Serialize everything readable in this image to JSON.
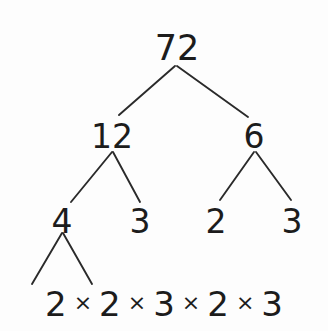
{
  "diagram": {
    "type": "factor-tree",
    "background_color": "#fdfdfd",
    "text_color": "#1c1c1c",
    "line_color": "#2a2a2a",
    "nodes": {
      "root": {
        "label": "72",
        "x": 177,
        "y": 31
      },
      "level1": [
        {
          "label": "12",
          "x": 112,
          "y": 120
        },
        {
          "label": "6",
          "x": 254,
          "y": 120
        }
      ],
      "level2": [
        {
          "label": "4",
          "x": 62,
          "y": 205
        },
        {
          "label": "3",
          "x": 140,
          "y": 205
        },
        {
          "label": "2",
          "x": 216,
          "y": 205
        },
        {
          "label": "3",
          "x": 292,
          "y": 205
        }
      ]
    },
    "edges": [
      {
        "from": "72",
        "to": "12",
        "x1": 175,
        "y1": 66,
        "x2": 119,
        "y2": 115
      },
      {
        "from": "72",
        "to": "6",
        "x1": 177,
        "y1": 66,
        "x2": 248,
        "y2": 117
      },
      {
        "from": "12",
        "to": "4",
        "x1": 112,
        "y1": 152,
        "x2": 71,
        "y2": 202
      },
      {
        "from": "12",
        "to": "3",
        "x1": 113,
        "y1": 152,
        "x2": 140,
        "y2": 202
      },
      {
        "from": "6",
        "to": "2",
        "x1": 254,
        "y1": 152,
        "x2": 220,
        "y2": 200
      },
      {
        "from": "6",
        "to": "3",
        "x1": 256,
        "y1": 152,
        "x2": 291,
        "y2": 200
      },
      {
        "from": "4",
        "to": "2a",
        "x1": 62,
        "y1": 233,
        "x2": 32,
        "y2": 284
      },
      {
        "from": "4",
        "to": "2b",
        "x1": 63,
        "y1": 233,
        "x2": 92,
        "y2": 284
      }
    ],
    "product": {
      "expression": "2 × 2 × 3 × 2 × 3",
      "operator": "×",
      "factors": [
        "2",
        "2",
        "3",
        "2",
        "3"
      ]
    }
  }
}
